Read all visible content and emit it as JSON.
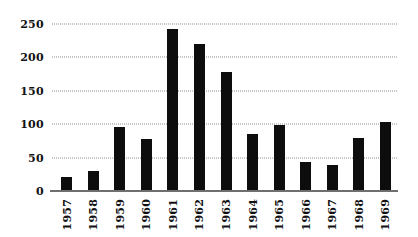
{
  "chart_data": {
    "type": "bar",
    "title": "",
    "subtitle": "",
    "xlabel": "",
    "ylabel": "",
    "categories": [
      "1957",
      "1958",
      "1959",
      "1960",
      "1961",
      "1962",
      "1963",
      "1964",
      "1965",
      "1966",
      "1967",
      "1968",
      "1969"
    ],
    "values": [
      21,
      30,
      96,
      78,
      242,
      220,
      178,
      85,
      99,
      43,
      39,
      80,
      104
    ],
    "series": [
      {
        "name": "",
        "values": [
          21,
          30,
          96,
          78,
          242,
          220,
          178,
          85,
          99,
          43,
          39,
          80,
          104
        ]
      }
    ],
    "ylim": [
      0,
      250
    ],
    "yticks": [
      0,
      50,
      100,
      150,
      200,
      250
    ],
    "ytick_labels": [
      "0",
      "50",
      "100",
      "150",
      "200",
      "250"
    ],
    "grid": true,
    "grid_axis": "y",
    "grid_style": "dotted",
    "legend": false,
    "legend_position": "none",
    "bar_color": "#0d0d0d",
    "grid_color": "#8d8d8d",
    "axis_color": "#6f6f6f",
    "background_color": "#ffffff",
    "xtick_rotation": -90
  }
}
